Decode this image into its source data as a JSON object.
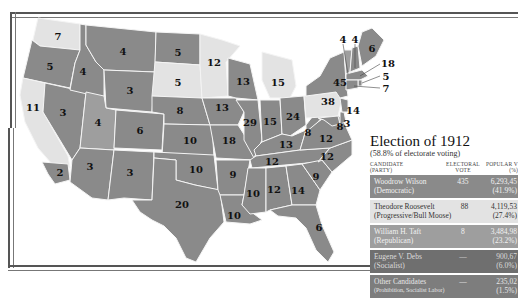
{
  "title": "Election of 1912",
  "subtitle": "(58.8% of electorate voting)",
  "colors": {
    "democratic": "#8a8a8a",
    "progressive": "#e3e3e3",
    "republican": "#9e9e9e",
    "socialist": "#6f6f6f",
    "other": "#7d7d7d",
    "border": "#f4f4f4"
  },
  "table": {
    "headers": {
      "candidate": "CANDIDATE",
      "candidate_sub": "(PARTY)",
      "electoral": "ELECTORAL",
      "electoral_sub": "VOTE",
      "popular": "POPULAR V",
      "popular_sub": "(%)"
    },
    "rows": [
      {
        "name": "Woodrow Wilson",
        "party": "(Democratic)",
        "electoral": "435",
        "popular": "6,293,45",
        "percent": "(41.9%)"
      },
      {
        "name": "Theodore Roosevelt",
        "party": "(Progressive/Bull Moose)",
        "electoral": "88",
        "popular": "4,119,53",
        "percent": "(27.4%)"
      },
      {
        "name": "William H. Taft",
        "party": "(Republican)",
        "electoral": "8",
        "popular": "3,484,98",
        "percent": "(23.2%)"
      },
      {
        "name": "Eugene V. Debs",
        "party": "(Socialist)",
        "electoral": "—",
        "popular": "900,67",
        "percent": "(6.0%)"
      },
      {
        "name": "Other Candidates",
        "party": "(Prohibition, Socialist Labor)",
        "electoral": "—",
        "popular": "235,02",
        "percent": "(1.5%)"
      }
    ]
  },
  "states": [
    {
      "abbr": "WA",
      "votes": "7",
      "party": "progressive"
    },
    {
      "abbr": "OR",
      "votes": "5",
      "party": "democratic"
    },
    {
      "abbr": "CA",
      "votes": "11",
      "party": "progressive"
    },
    {
      "abbr": "CA-south",
      "votes": "2",
      "party": "democratic"
    },
    {
      "abbr": "ID",
      "votes": "4",
      "party": "democratic"
    },
    {
      "abbr": "NV",
      "votes": "3",
      "party": "democratic"
    },
    {
      "abbr": "MT",
      "votes": "4",
      "party": "democratic"
    },
    {
      "abbr": "WY",
      "votes": "3",
      "party": "democratic"
    },
    {
      "abbr": "UT",
      "votes": "4",
      "party": "republican"
    },
    {
      "abbr": "CO",
      "votes": "6",
      "party": "democratic"
    },
    {
      "abbr": "AZ",
      "votes": "3",
      "party": "democratic"
    },
    {
      "abbr": "NM",
      "votes": "3",
      "party": "democratic"
    },
    {
      "abbr": "ND",
      "votes": "5",
      "party": "democratic"
    },
    {
      "abbr": "SD",
      "votes": "5",
      "party": "progressive"
    },
    {
      "abbr": "NE",
      "votes": "8",
      "party": "democratic"
    },
    {
      "abbr": "KS",
      "votes": "10",
      "party": "democratic"
    },
    {
      "abbr": "OK",
      "votes": "10",
      "party": "democratic"
    },
    {
      "abbr": "TX",
      "votes": "20",
      "party": "democratic"
    },
    {
      "abbr": "MN",
      "votes": "12",
      "party": "progressive"
    },
    {
      "abbr": "IA",
      "votes": "13",
      "party": "democratic"
    },
    {
      "abbr": "MO",
      "votes": "18",
      "party": "democratic"
    },
    {
      "abbr": "AR",
      "votes": "9",
      "party": "democratic"
    },
    {
      "abbr": "LA",
      "votes": "10",
      "party": "democratic"
    },
    {
      "abbr": "WI",
      "votes": "13",
      "party": "democratic"
    },
    {
      "abbr": "IL",
      "votes": "29",
      "party": "democratic"
    },
    {
      "abbr": "MI",
      "votes": "15",
      "party": "progressive"
    },
    {
      "abbr": "IN",
      "votes": "15",
      "party": "democratic"
    },
    {
      "abbr": "OH",
      "votes": "24",
      "party": "democratic"
    },
    {
      "abbr": "KY",
      "votes": "13",
      "party": "democratic"
    },
    {
      "abbr": "TN",
      "votes": "12",
      "party": "democratic"
    },
    {
      "abbr": "MS",
      "votes": "10",
      "party": "democratic"
    },
    {
      "abbr": "AL",
      "votes": "12",
      "party": "democratic"
    },
    {
      "abbr": "GA",
      "votes": "14",
      "party": "democratic"
    },
    {
      "abbr": "FL",
      "votes": "6",
      "party": "democratic"
    },
    {
      "abbr": "SC",
      "votes": "9",
      "party": "democratic"
    },
    {
      "abbr": "NC",
      "votes": "12",
      "party": "democratic"
    },
    {
      "abbr": "VA",
      "votes": "12",
      "party": "democratic"
    },
    {
      "abbr": "WV",
      "votes": "8",
      "party": "democratic"
    },
    {
      "abbr": "PA",
      "votes": "38",
      "party": "progressive"
    },
    {
      "abbr": "NY",
      "votes": "45",
      "party": "democratic"
    },
    {
      "abbr": "NJ",
      "votes": "14",
      "party": "democratic"
    },
    {
      "abbr": "DE",
      "votes": "3",
      "party": "democratic"
    },
    {
      "abbr": "MD",
      "votes": "8",
      "party": "democratic"
    },
    {
      "abbr": "VT",
      "votes": "4",
      "party": "republican"
    },
    {
      "abbr": "NH",
      "votes": "4",
      "party": "democratic"
    },
    {
      "abbr": "ME",
      "votes": "6",
      "party": "democratic"
    },
    {
      "abbr": "MA",
      "votes": "18",
      "party": "democratic"
    },
    {
      "abbr": "RI",
      "votes": "5",
      "party": "democratic"
    },
    {
      "abbr": "CT",
      "votes": "7",
      "party": "democratic"
    }
  ]
}
